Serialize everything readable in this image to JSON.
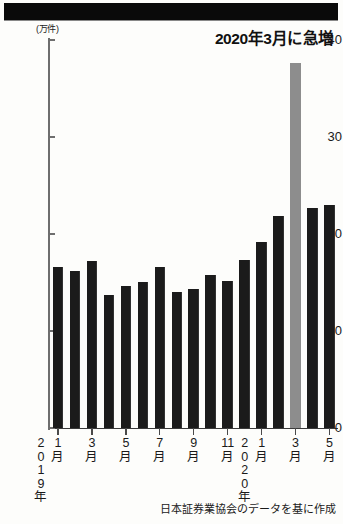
{
  "header": {
    "band_color": "#0a0a0a"
  },
  "annotation": {
    "text": "2020年3月に急増"
  },
  "source": {
    "text": "日本証券業協会のデータを基に作成"
  },
  "axis": {
    "unit_label": "(万件)",
    "y_ticks": [
      "0",
      "10",
      "20",
      "30",
      "40"
    ]
  },
  "year_labels": [
    {
      "text": "2\n0\n1\n9\n年",
      "index": 0
    },
    {
      "text": "2\n0\n2\n0\n年",
      "index": 12
    }
  ],
  "chart_data": {
    "type": "bar",
    "title": "2020年3月に急増",
    "xlabel": "",
    "ylabel": "(万件)",
    "ylim": [
      0,
      40
    ],
    "yticks": [
      0,
      10,
      20,
      30,
      40
    ],
    "grid": false,
    "legend": null,
    "source_note": "日本証券業協会のデータを基に作成",
    "highlight_index": 14,
    "highlight_color": "#8d8d8d",
    "bar_color": "#1b1b1b",
    "categories": [
      "2019年1月",
      "2019年2月",
      "2019年3月",
      "2019年4月",
      "2019年5月",
      "2019年6月",
      "2019年7月",
      "2019年8月",
      "2019年9月",
      "2019年10月",
      "2019年11月",
      "2019年12月",
      "2020年1月",
      "2020年2月",
      "2020年3月",
      "2020年4月",
      "2020年5月"
    ],
    "tick_labels": [
      {
        "at": 0,
        "text": "1\n月"
      },
      {
        "at": 2,
        "text": "3\n月"
      },
      {
        "at": 4,
        "text": "5\n月"
      },
      {
        "at": 6,
        "text": "7\n月"
      },
      {
        "at": 8,
        "text": "9\n月"
      },
      {
        "at": 10,
        "text": "11\n月"
      },
      {
        "at": 12,
        "text": "1\n月"
      },
      {
        "at": 14,
        "text": "3\n月"
      },
      {
        "at": 16,
        "text": "5\n月"
      }
    ],
    "values": [
      16.6,
      16.2,
      17.2,
      13.7,
      14.6,
      15.1,
      16.6,
      14.0,
      14.3,
      15.8,
      15.2,
      17.3,
      19.2,
      21.9,
      37.6,
      22.7,
      23.0
    ]
  }
}
